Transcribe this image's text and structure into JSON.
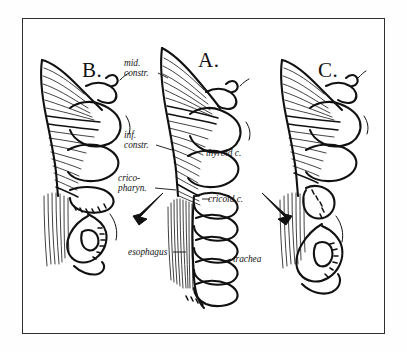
{
  "figure": {
    "title_letters": [
      {
        "id": "panel-a",
        "text": "A."
      },
      {
        "id": "panel-b",
        "text": "B."
      },
      {
        "id": "panel-c",
        "text": "C."
      }
    ],
    "labels": [
      {
        "id": "mid-constr",
        "line1": "mid.",
        "line2": "constr."
      },
      {
        "id": "inf-constr",
        "line1": "inf.",
        "line2": "constr."
      },
      {
        "id": "crico-pharyn",
        "line1": "crico-",
        "line2": "pharyn."
      },
      {
        "id": "thyroid-c",
        "line1": "thyroid c.",
        "line2": ""
      },
      {
        "id": "cricoid-c",
        "line1": "cricoid c.",
        "line2": ""
      },
      {
        "id": "esophagus",
        "line1": "esophagus",
        "line2": ""
      },
      {
        "id": "trachea",
        "line1": "trachea",
        "line2": ""
      }
    ],
    "arrows": [
      {
        "id": "arrow-left",
        "direction": "down-left"
      },
      {
        "id": "arrow-right",
        "direction": "down-right"
      }
    ],
    "colors": {
      "ink": "#111111",
      "frame": "#2e3033",
      "paper": "#ffffff",
      "page": "#fefefe"
    }
  }
}
